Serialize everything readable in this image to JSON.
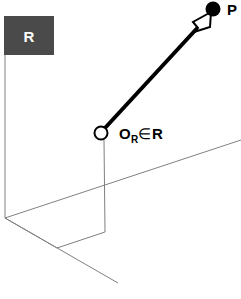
{
  "figure": {
    "kind": "3d-reference-frame-vector-diagram",
    "width": 241,
    "height": 299,
    "background_color": "#ffffff"
  },
  "region": {
    "label": "R",
    "fill_color": "#4a4a4a",
    "label_color": "#ffffff",
    "box": {
      "x": 4,
      "y": 16,
      "width": 50,
      "height": 39
    }
  },
  "origin": {
    "symbol": "O",
    "subscript": "R",
    "membership": "∈",
    "set": "R",
    "full_label": "Oᵣ∈R",
    "marker": "open-circle",
    "marker_fill": "#ffffff",
    "marker_stroke": "#000000",
    "position": {
      "x": 101,
      "y": 133,
      "radius": 6.5
    }
  },
  "point": {
    "label": "P",
    "marker": "filled-circle",
    "marker_fill": "#000000",
    "position": {
      "x": 213,
      "y": 9,
      "radius": 7
    }
  },
  "vector": {
    "name": "position-vector",
    "color": "#000000",
    "stroke_width": 4,
    "from": {
      "x": 105,
      "y": 128
    },
    "to": {
      "x": 210,
      "y": 14
    },
    "arrowhead": {
      "style": "open-triangle",
      "fill": "#ffffff",
      "stroke": "#000000"
    }
  },
  "axes": {
    "color": "#808080",
    "stroke_width": 1,
    "lines": [
      {
        "name": "left-vertical-edge",
        "x1": 5,
        "y1": 55,
        "x2": 5,
        "y2": 218
      },
      {
        "name": "ground-plane-far-edge",
        "x1": 5,
        "y1": 218,
        "x2": 240,
        "y2": 140
      },
      {
        "name": "ground-plane-near-edge",
        "x1": 5,
        "y1": 218,
        "x2": 118,
        "y2": 283
      },
      {
        "name": "origin-drop-line",
        "x1": 104,
        "y1": 140,
        "x2": 105,
        "y2": 232
      },
      {
        "name": "plane-bottom-edge",
        "x1": 105,
        "y1": 232,
        "x2": 57,
        "y2": 248
      },
      {
        "name": "plane-inner-edge",
        "x1": 57,
        "y1": 248,
        "x2": 5,
        "y2": 218
      }
    ]
  }
}
